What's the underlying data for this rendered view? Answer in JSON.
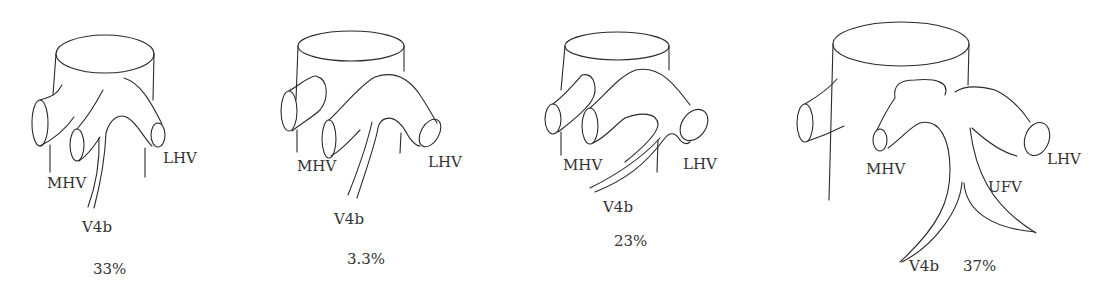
{
  "figure": {
    "panels": [
      {
        "id": "panel-1",
        "labels": {
          "mhv": "MHV",
          "lhv": "LHV",
          "v4b": "V4b"
        },
        "percentage": "33%"
      },
      {
        "id": "panel-2",
        "labels": {
          "mhv": "MHV",
          "lhv": "LHV",
          "v4b": "V4b"
        },
        "percentage": "3.3%"
      },
      {
        "id": "panel-3",
        "labels": {
          "mhv": "MHV",
          "lhv": "LHV",
          "v4b": "V4b"
        },
        "percentage": "23%"
      },
      {
        "id": "panel-4",
        "labels": {
          "mhv": "MHV",
          "lhv": "LHV",
          "ufv": "UFV",
          "v4b": "V4b"
        },
        "percentage": "37%"
      }
    ]
  }
}
